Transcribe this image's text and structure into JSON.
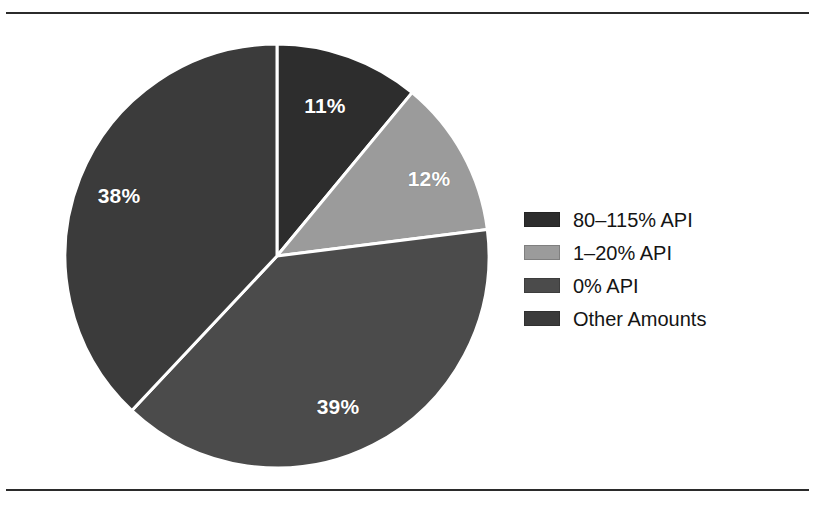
{
  "figure": {
    "background_color": "#ffffff",
    "rule_color": "#2b2b2b"
  },
  "chart_data": {
    "type": "pie",
    "title": "",
    "categories": [
      "80–115% API",
      "1–20% API",
      "0% API",
      "Other Amounts"
    ],
    "values": [
      11,
      12,
      39,
      38
    ],
    "value_labels": [
      "11%",
      "12%",
      "39%",
      "38%"
    ],
    "unit": "percent",
    "colors": [
      "#2d2d2d",
      "#9b9b9b",
      "#4b4b4b",
      "#3b3b3b"
    ],
    "slice_separator_color": "#ffffff",
    "label_color": "#ffffff",
    "start_angle_deg": 0,
    "direction": "clockwise",
    "legend_position": "right",
    "grid": false
  },
  "pie": {
    "center_x": 277,
    "center_y": 256,
    "radius": 212,
    "slices": [
      {
        "name": "80–115% API",
        "value": 11,
        "label": "11%",
        "color": "#2d2d2d",
        "label_x": 325,
        "label_y": 106
      },
      {
        "name": "1–20% API",
        "value": 12,
        "label": "12%",
        "color": "#9b9b9b",
        "label_x": 429,
        "label_y": 179
      },
      {
        "name": "0% API",
        "value": 39,
        "label": "39%",
        "color": "#4b4b4b",
        "label_x": 338,
        "label_y": 407
      },
      {
        "name": "Other Amounts",
        "value": 38,
        "label": "38%",
        "color": "#3b3b3b",
        "label_x": 119,
        "label_y": 196
      }
    ]
  },
  "legend": {
    "items": [
      {
        "label": "80–115% API",
        "color": "#2d2d2d"
      },
      {
        "label": "1–20% API",
        "color": "#9b9b9b"
      },
      {
        "label": "0% API",
        "color": "#4b4b4b"
      },
      {
        "label": "Other Amounts",
        "color": "#3b3b3b"
      }
    ]
  }
}
